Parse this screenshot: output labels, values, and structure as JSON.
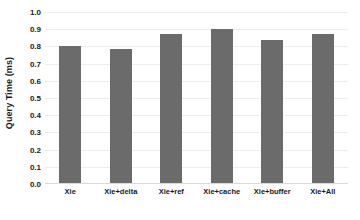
{
  "chart_data": {
    "type": "bar",
    "title": "",
    "subtitle": "",
    "xlabel": "",
    "ylabel": "Query Time (ms)",
    "categories": [
      "Xie",
      "Xie+delta",
      "Xie+ref",
      "Xie+cache",
      "Xie+buffer",
      "Xie+All"
    ],
    "values": [
      0.8,
      0.785,
      0.87,
      0.9,
      0.84,
      0.875
    ],
    "series": [
      {
        "name": "Query Time",
        "values": [
          0.8,
          0.785,
          0.87,
          0.9,
          0.84,
          0.875
        ]
      }
    ],
    "ylim": [
      0.0,
      1.0
    ],
    "ytick_labels": [
      "1.0",
      "0.9",
      "0.8",
      "0.7",
      "0.6",
      "0.5",
      "0.4",
      "0.3",
      "0.2",
      "0.1",
      "0.0"
    ],
    "ytick_values": [
      1.0,
      0.9,
      0.8,
      0.7,
      0.6,
      0.5,
      0.4,
      0.3,
      0.2,
      0.1,
      0.0
    ],
    "ytick_step": 0.1,
    "grid": true,
    "grid_axis": "y",
    "legend": false,
    "legend_position": "none",
    "bar_color": "#6b6b6b",
    "gridline_color": "#ededed",
    "axis_color": "#d9d9d9",
    "text_color": "#1a1a1a",
    "background_color": "#ffffff",
    "annotations": []
  }
}
